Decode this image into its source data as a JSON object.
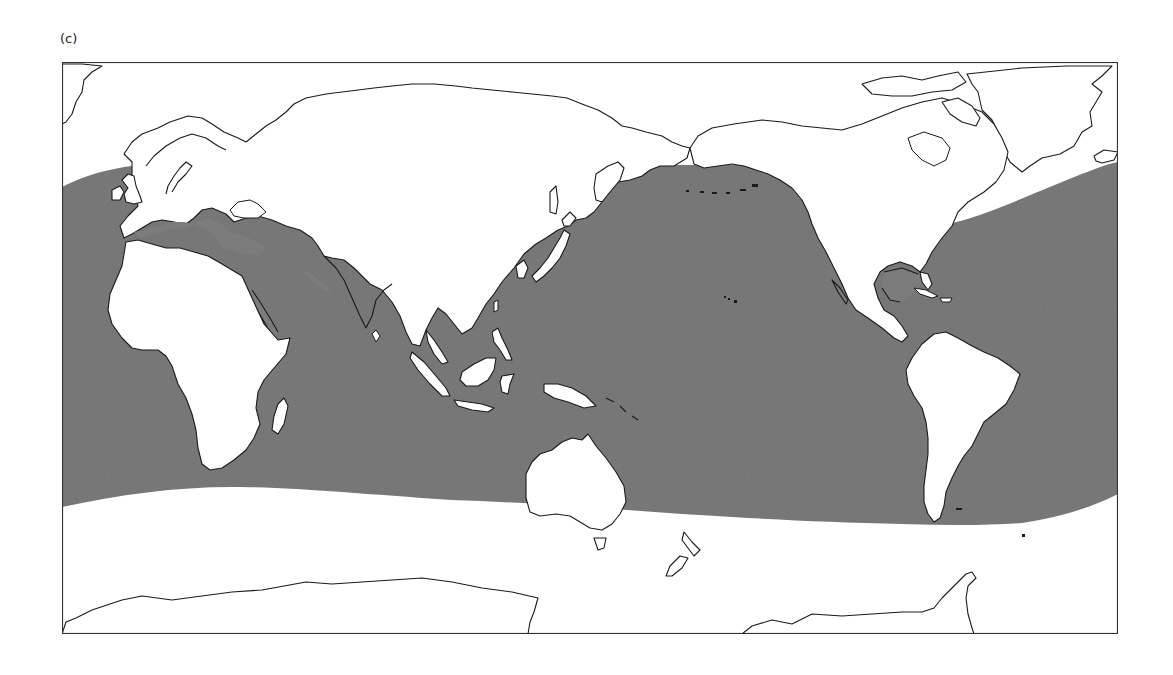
{
  "figure": {
    "panel_label": "(c)",
    "projection": "equirectangular, Pacific-centered (~150°E center)",
    "legend": null
  },
  "map": {
    "background_color": "#ffffff",
    "land_color": "#ffffff",
    "coastline_color": "#1a1a1a",
    "distribution_fill_color": "#7c7c7c",
    "frame_color": "#333333",
    "distribution_region": {
      "description": "Shaded ocean band covering roughly 60°N to 40–55°S across Atlantic, Indian and Pacific Oceans",
      "north_edge_px": [
        [
          0,
          125
        ],
        [
          30,
          112
        ],
        [
          70,
          102
        ],
        [
          200,
          100
        ],
        [
          300,
          103
        ],
        [
          470,
          105
        ],
        [
          520,
          104
        ],
        [
          620,
          103
        ],
        [
          700,
          103
        ],
        [
          880,
          160
        ],
        [
          960,
          140
        ],
        [
          1020,
          115
        ],
        [
          1056,
          100
        ]
      ],
      "south_edge_px": [
        [
          0,
          445
        ],
        [
          50,
          432
        ],
        [
          120,
          425
        ],
        [
          250,
          430
        ],
        [
          390,
          442
        ],
        [
          560,
          452
        ],
        [
          700,
          460
        ],
        [
          870,
          463
        ],
        [
          940,
          462
        ],
        [
          1000,
          450
        ],
        [
          1056,
          432
        ]
      ]
    },
    "regions_visible": [
      "Greenland",
      "Iceland",
      "Europe",
      "Africa",
      "Madagascar",
      "Arabian Peninsula",
      "India",
      "Sri Lanka",
      "Asia",
      "Japan",
      "Southeast Asia",
      "Indonesia",
      "New Guinea",
      "Australia",
      "Tasmania",
      "New Zealand",
      "North America",
      "Central America",
      "Caribbean",
      "South America",
      "Antarctica"
    ]
  }
}
